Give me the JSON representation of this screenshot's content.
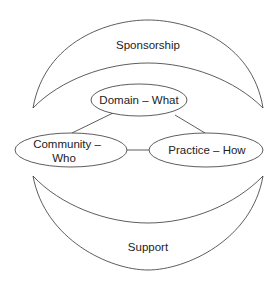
{
  "diagram": {
    "top_crescent": {
      "label": "Sponsorship"
    },
    "bottom_crescent": {
      "label": "Support"
    },
    "nodes": [
      {
        "id": "domain",
        "label": "Domain – What"
      },
      {
        "id": "community",
        "label_line1": "Community –",
        "label_line2": "Who"
      },
      {
        "id": "practice",
        "label": "Practice – How"
      }
    ],
    "edges": [
      {
        "from": "domain",
        "to": "community"
      },
      {
        "from": "domain",
        "to": "practice"
      },
      {
        "from": "community",
        "to": "practice"
      }
    ],
    "colors": {
      "stroke": "#333333",
      "text": "#222222",
      "background": "#ffffff"
    }
  }
}
